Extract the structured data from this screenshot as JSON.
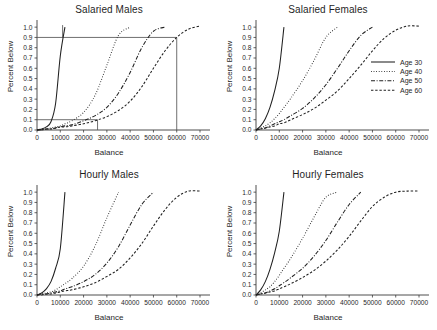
{
  "figure": {
    "background_color": "#ffffff",
    "line_color": "#202020",
    "reference_line_color": "#555555",
    "axis_color": "#3a3a3a"
  },
  "legend": {
    "position": "inside top-right panel, right side",
    "entries": [
      {
        "label": "Age 30",
        "dash": "solid"
      },
      {
        "label": "Age 40",
        "dash": "dotted"
      },
      {
        "label": "Age 50",
        "dash": "dash-dot"
      },
      {
        "label": "Age 60",
        "dash": "dashed"
      }
    ]
  },
  "chart_data": [
    {
      "type": "line",
      "title": "Salaried Males",
      "xlabel": "Balance",
      "ylabel": "Percent Below",
      "xlim": [
        0,
        73000
      ],
      "ylim": [
        0,
        1.05
      ],
      "xticks": [
        0,
        10000,
        20000,
        30000,
        40000,
        50000,
        60000,
        70000
      ],
      "xticklabels": [
        "0",
        "10000",
        "20000",
        "30000",
        "40000",
        "50000",
        "60000",
        "70000"
      ],
      "yticks": [
        0.0,
        0.1,
        0.2,
        0.3,
        0.4,
        0.5,
        0.6,
        0.7,
        0.8,
        0.9,
        1.0
      ],
      "yticklabels": [
        "0.0",
        "0.1",
        "0.2",
        "0.3",
        "0.4",
        "0.5",
        "0.6",
        "0.7",
        "0.8",
        "0.9",
        "1.0"
      ],
      "grid": false,
      "legend_position": "none",
      "annotations": [
        {
          "kind": "hline",
          "y": 0.9,
          "x_from": 0,
          "x_to": 60000
        },
        {
          "kind": "vline",
          "x": 11000,
          "y_from": 0.9,
          "y_to": 1.02
        },
        {
          "kind": "vline",
          "x": 60000,
          "y_from": 0.0,
          "y_to": 0.9
        },
        {
          "kind": "hline",
          "y": 0.1,
          "x_from": 0,
          "x_to": 26000
        },
        {
          "kind": "vline",
          "x": 26000,
          "y_from": 0.0,
          "y_to": 0.1
        }
      ],
      "x": [
        0,
        2000,
        4000,
        6000,
        8000,
        10000,
        12000,
        15000,
        20000,
        25000,
        30000,
        35000,
        40000,
        45000,
        50000,
        55000,
        60000,
        65000,
        70000
      ],
      "series": [
        {
          "name": "Age 30",
          "dash": "solid",
          "values": [
            0.0,
            0.01,
            0.03,
            0.08,
            0.26,
            0.72,
            1.0,
            null,
            null,
            null,
            null,
            null,
            null,
            null,
            null,
            null,
            null,
            null,
            null
          ]
        },
        {
          "name": "Age 40",
          "dash": "dotted",
          "values": [
            0.0,
            0.01,
            0.01,
            0.02,
            0.03,
            0.04,
            0.06,
            0.09,
            0.17,
            0.34,
            0.63,
            0.92,
            1.0,
            null,
            null,
            null,
            null,
            null,
            null
          ]
        },
        {
          "name": "Age 50",
          "dash": "dash-dot",
          "values": [
            0.0,
            0.0,
            0.01,
            0.01,
            0.02,
            0.03,
            0.04,
            0.05,
            0.09,
            0.14,
            0.22,
            0.36,
            0.56,
            0.8,
            0.96,
            1.0,
            null,
            null,
            null
          ]
        },
        {
          "name": "Age 60",
          "dash": "dashed",
          "values": [
            0.0,
            0.0,
            0.01,
            0.01,
            0.02,
            0.03,
            0.03,
            0.04,
            0.06,
            0.09,
            0.13,
            0.19,
            0.28,
            0.42,
            0.6,
            0.77,
            0.9,
            0.98,
            1.01
          ]
        }
      ]
    },
    {
      "type": "line",
      "title": "Salaried Females",
      "xlabel": "Balance",
      "ylabel": "Percent Below",
      "xlim": [
        0,
        73000
      ],
      "ylim": [
        0,
        1.05
      ],
      "xticks": [
        0,
        10000,
        20000,
        30000,
        40000,
        50000,
        60000,
        70000
      ],
      "xticklabels": [
        "0",
        "10000",
        "20000",
        "30000",
        "40000",
        "50000",
        "60000",
        "70000"
      ],
      "yticks": [
        0.0,
        0.1,
        0.2,
        0.3,
        0.4,
        0.5,
        0.6,
        0.7,
        0.8,
        0.9,
        1.0
      ],
      "yticklabels": [
        "0.0",
        "0.1",
        "0.2",
        "0.3",
        "0.4",
        "0.5",
        "0.6",
        "0.7",
        "0.8",
        "0.9",
        "1.0"
      ],
      "grid": false,
      "legend_position": "center right",
      "annotations": [],
      "x": [
        0,
        2000,
        4000,
        6000,
        8000,
        10000,
        12000,
        15000,
        20000,
        25000,
        30000,
        35000,
        40000,
        45000,
        50000,
        55000,
        60000,
        65000,
        70000
      ],
      "series": [
        {
          "name": "Age 30",
          "dash": "solid",
          "values": [
            0.0,
            0.04,
            0.11,
            0.22,
            0.38,
            0.6,
            1.0,
            null,
            null,
            null,
            null,
            null,
            null,
            null,
            null,
            null,
            null,
            null,
            null
          ]
        },
        {
          "name": "Age 40",
          "dash": "dotted",
          "values": [
            0.0,
            0.02,
            0.04,
            0.07,
            0.11,
            0.16,
            0.22,
            0.31,
            0.48,
            0.68,
            0.9,
            1.0,
            null,
            null,
            null,
            null,
            null,
            null,
            null
          ]
        },
        {
          "name": "Age 50",
          "dash": "dash-dot",
          "values": [
            0.0,
            0.01,
            0.02,
            0.04,
            0.06,
            0.08,
            0.1,
            0.14,
            0.21,
            0.31,
            0.44,
            0.6,
            0.77,
            0.92,
            1.0,
            null,
            null,
            null,
            null
          ]
        },
        {
          "name": "Age 60",
          "dash": "dashed",
          "values": [
            0.0,
            0.01,
            0.02,
            0.03,
            0.04,
            0.06,
            0.07,
            0.1,
            0.15,
            0.21,
            0.29,
            0.38,
            0.5,
            0.63,
            0.77,
            0.89,
            0.97,
            1.01,
            1.01
          ]
        }
      ]
    },
    {
      "type": "line",
      "title": "Hourly Males",
      "xlabel": "Balance",
      "ylabel": "Percent Below",
      "xlim": [
        0,
        73000
      ],
      "ylim": [
        0,
        1.05
      ],
      "xticks": [
        0,
        10000,
        20000,
        30000,
        40000,
        50000,
        60000,
        70000
      ],
      "xticklabels": [
        "0",
        "10000",
        "20000",
        "30000",
        "40000",
        "50000",
        "60000",
        "70000"
      ],
      "yticks": [
        0.0,
        0.1,
        0.2,
        0.3,
        0.4,
        0.5,
        0.6,
        0.7,
        0.8,
        0.9,
        1.0
      ],
      "yticklabels": [
        "0.0",
        "0.1",
        "0.2",
        "0.3",
        "0.4",
        "0.5",
        "0.6",
        "0.7",
        "0.8",
        "0.9",
        "1.0"
      ],
      "grid": false,
      "legend_position": "none",
      "annotations": [],
      "x": [
        0,
        2000,
        4000,
        6000,
        8000,
        10000,
        12000,
        15000,
        20000,
        25000,
        30000,
        35000,
        40000,
        45000,
        50000,
        55000,
        60000,
        65000,
        70000
      ],
      "series": [
        {
          "name": "Age 30",
          "dash": "solid",
          "values": [
            0.0,
            0.02,
            0.06,
            0.13,
            0.26,
            0.45,
            1.0,
            null,
            null,
            null,
            null,
            null,
            null,
            null,
            null,
            null,
            null,
            null,
            null
          ]
        },
        {
          "name": "Age 40",
          "dash": "dotted",
          "values": [
            0.0,
            0.01,
            0.02,
            0.03,
            0.05,
            0.08,
            0.11,
            0.16,
            0.28,
            0.48,
            0.75,
            1.0,
            null,
            null,
            null,
            null,
            null,
            null,
            null
          ]
        },
        {
          "name": "Age 50",
          "dash": "dash-dot",
          "values": [
            0.0,
            0.01,
            0.01,
            0.02,
            0.03,
            0.04,
            0.06,
            0.08,
            0.13,
            0.2,
            0.31,
            0.47,
            0.68,
            0.88,
            1.0,
            null,
            null,
            null,
            null
          ]
        },
        {
          "name": "Age 60",
          "dash": "dashed",
          "values": [
            0.0,
            0.0,
            0.01,
            0.01,
            0.02,
            0.03,
            0.04,
            0.05,
            0.08,
            0.12,
            0.18,
            0.25,
            0.36,
            0.5,
            0.67,
            0.83,
            0.95,
            1.01,
            1.01
          ]
        }
      ]
    },
    {
      "type": "line",
      "title": "Hourly Females",
      "xlabel": "Balance",
      "ylabel": "Percent Below",
      "xlim": [
        0,
        73000
      ],
      "ylim": [
        0,
        1.05
      ],
      "xticks": [
        0,
        10000,
        20000,
        30000,
        40000,
        50000,
        60000,
        70000
      ],
      "xticklabels": [
        "0",
        "10000",
        "20000",
        "30000",
        "40000",
        "50000",
        "60000",
        "70000"
      ],
      "yticks": [
        0.0,
        0.1,
        0.2,
        0.3,
        0.4,
        0.5,
        0.6,
        0.7,
        0.8,
        0.9,
        1.0
      ],
      "yticklabels": [
        "0.0",
        "0.1",
        "0.2",
        "0.3",
        "0.4",
        "0.5",
        "0.6",
        "0.7",
        "0.8",
        "0.9",
        "1.0"
      ],
      "grid": false,
      "legend_position": "none",
      "annotations": [],
      "x": [
        0,
        2000,
        4000,
        6000,
        8000,
        10000,
        12000,
        15000,
        20000,
        25000,
        30000,
        35000,
        40000,
        45000,
        50000,
        55000,
        60000,
        65000,
        70000
      ],
      "series": [
        {
          "name": "Age 30",
          "dash": "solid",
          "values": [
            0.0,
            0.05,
            0.13,
            0.25,
            0.41,
            0.62,
            1.0,
            null,
            null,
            null,
            null,
            null,
            null,
            null,
            null,
            null,
            null,
            null,
            null
          ]
        },
        {
          "name": "Age 40",
          "dash": "dotted",
          "values": [
            0.0,
            0.02,
            0.05,
            0.08,
            0.13,
            0.19,
            0.26,
            0.36,
            0.55,
            0.76,
            0.95,
            1.0,
            null,
            null,
            null,
            null,
            null,
            null,
            null
          ]
        },
        {
          "name": "Age 50",
          "dash": "dash-dot",
          "values": [
            0.0,
            0.01,
            0.02,
            0.04,
            0.06,
            0.09,
            0.12,
            0.17,
            0.26,
            0.38,
            0.53,
            0.71,
            0.88,
            1.0,
            null,
            null,
            null,
            null,
            null
          ]
        },
        {
          "name": "Age 60",
          "dash": "dashed",
          "values": [
            0.0,
            0.01,
            0.02,
            0.03,
            0.04,
            0.06,
            0.08,
            0.11,
            0.17,
            0.24,
            0.33,
            0.44,
            0.57,
            0.72,
            0.86,
            0.95,
            1.0,
            1.01,
            1.01
          ]
        }
      ]
    }
  ]
}
